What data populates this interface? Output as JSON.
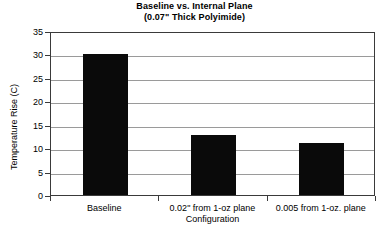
{
  "chart_data": {
    "type": "bar",
    "title": "Baseline vs. Internal Plane",
    "subtitle": "(0.07\" Thick Polyimide)",
    "xlabel": "Configuration",
    "ylabel": "Temperature Rise (C)",
    "categories": [
      "Baseline",
      "0.02\" from 1-oz plane",
      "0.005 from 1-oz. plane"
    ],
    "values": [
      30,
      12.7,
      11
    ],
    "ylim": [
      0,
      35
    ],
    "ytick_labels": [
      "0",
      "5",
      "10",
      "15",
      "20",
      "25",
      "30",
      "35"
    ],
    "ytick_values": [
      0,
      5,
      10,
      15,
      20,
      25,
      30,
      35
    ],
    "grid": true,
    "legend": false,
    "bar_color": "#0a0a0a",
    "gridline_color": "#9a9a9a",
    "axis_color": "#3a3a3a",
    "background_color": "#ffffff"
  }
}
